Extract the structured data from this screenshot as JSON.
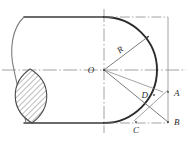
{
  "figure": {
    "type": "engineering-drawing",
    "background_color": "#ffffff",
    "outline_color": "#3a3a3a",
    "thin_line_color": "#7b7b7b",
    "center_line_color": "#8c8c8c",
    "hatch_color": "#5a5a5a",
    "canvas": {
      "width": 190,
      "height": 141
    }
  },
  "labels": {
    "center": "O",
    "radius": "R",
    "point_a": "A",
    "point_b": "B",
    "point_c": "C",
    "point_d": "D"
  },
  "geometry": {
    "center_point": {
      "x": 104,
      "y": 70
    },
    "top_edge_y": 17,
    "bottom_edge_y": 123,
    "left_edge_x": 14,
    "right_construction_x": 168,
    "radius_px": 53,
    "arc_start": {
      "x": 104,
      "y": 17
    },
    "arc_end": {
      "x": 104,
      "y": 123
    },
    "radius_leader_end": {
      "x": 149,
      "y": 36
    },
    "point_a_pos": {
      "x": 168,
      "y": 95
    },
    "point_b_pos": {
      "x": 168,
      "y": 122
    },
    "point_c_pos": {
      "x": 139,
      "y": 124
    },
    "point_d_pos": {
      "x": 152,
      "y": 94
    },
    "hatched_lens": {
      "top": {
        "x": 30,
        "y": 69
      },
      "bottom": {
        "x": 32,
        "y": 123
      },
      "bulge_left_x": 11,
      "bulge_right_x": 50
    }
  }
}
